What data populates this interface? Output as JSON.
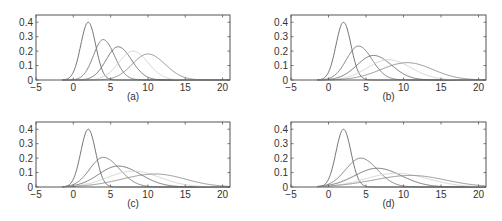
{
  "figure": {
    "width": 502,
    "height": 221,
    "axis_color": "#555555",
    "panels_layout": [
      {
        "id": "a",
        "left": 36,
        "top": 15,
        "right": 230,
        "bottom": 80,
        "label_y": 100
      },
      {
        "id": "b",
        "left": 291,
        "top": 15,
        "right": 486,
        "bottom": 80,
        "label_y": 100
      },
      {
        "id": "c",
        "left": 36,
        "top": 122,
        "right": 230,
        "bottom": 187,
        "label_y": 207
      },
      {
        "id": "d",
        "left": 291,
        "top": 122,
        "right": 486,
        "bottom": 187,
        "label_y": 207
      }
    ]
  },
  "chart_data": [
    {
      "type": "line",
      "panel_label": "(a)",
      "xlim": [
        -5,
        21
      ],
      "ylim": [
        0,
        0.45
      ],
      "xticks": [
        -5,
        0,
        5,
        10,
        15,
        20
      ],
      "xtick_labels": [
        "−5",
        "0",
        "5",
        "10",
        "15",
        "20"
      ],
      "yticks": [
        0,
        0.1,
        0.2,
        0.3,
        0.4
      ],
      "ytick_labels": [
        "0",
        "0.1",
        "0.2",
        "0.3",
        "0.4"
      ],
      "grid": false,
      "legend": null,
      "series": [
        {
          "name": "curve 1",
          "mode": 2,
          "peak": 0.4,
          "sd_left": 1.0,
          "sd_right": 1.0,
          "color": "#666666"
        },
        {
          "name": "curve 2",
          "mode": 4,
          "peak": 0.28,
          "sd_left": 1.3,
          "sd_right": 1.5,
          "color": "#777777"
        },
        {
          "name": "curve 3",
          "mode": 6,
          "peak": 0.23,
          "sd_left": 1.6,
          "sd_right": 1.8,
          "color": "#6a6a6a"
        },
        {
          "name": "curve 4",
          "mode": 8,
          "peak": 0.2,
          "sd_left": 1.9,
          "sd_right": 2.0,
          "color": "#cfcfcf"
        },
        {
          "name": "curve 5",
          "mode": 10,
          "peak": 0.18,
          "sd_left": 2.1,
          "sd_right": 2.3,
          "color": "#8a8a8a"
        }
      ]
    },
    {
      "type": "line",
      "panel_label": "(b)",
      "xlim": [
        -5,
        21
      ],
      "ylim": [
        0,
        0.45
      ],
      "xticks": [
        -5,
        0,
        5,
        10,
        15,
        20
      ],
      "xtick_labels": [
        "−5",
        "0",
        "5",
        "10",
        "15",
        "20"
      ],
      "yticks": [
        0,
        0.1,
        0.2,
        0.3,
        0.4
      ],
      "ytick_labels": [
        "0",
        "0.1",
        "0.2",
        "0.3",
        "0.4"
      ],
      "grid": false,
      "legend": null,
      "series": [
        {
          "name": "curve 1",
          "mode": 2,
          "peak": 0.4,
          "sd_left": 1.0,
          "sd_right": 1.0,
          "color": "#666666"
        },
        {
          "name": "curve 2",
          "mode": 4,
          "peak": 0.235,
          "sd_left": 1.6,
          "sd_right": 1.8,
          "color": "#777777"
        },
        {
          "name": "curve 3",
          "mode": 6,
          "peak": 0.17,
          "sd_left": 2.2,
          "sd_right": 2.4,
          "color": "#6a6a6a"
        },
        {
          "name": "curve 4",
          "mode": 8,
          "peak": 0.14,
          "sd_left": 2.8,
          "sd_right": 3.0,
          "color": "#cfcfcf"
        },
        {
          "name": "curve 5",
          "mode": 10.5,
          "peak": 0.12,
          "sd_left": 3.5,
          "sd_right": 3.4,
          "color": "#8a8a8a"
        }
      ]
    },
    {
      "type": "line",
      "panel_label": "(c)",
      "xlim": [
        -5,
        21
      ],
      "ylim": [
        0,
        0.45
      ],
      "xticks": [
        -5,
        0,
        5,
        10,
        15,
        20
      ],
      "xtick_labels": [
        "−5",
        "0",
        "5",
        "10",
        "15",
        "20"
      ],
      "yticks": [
        0,
        0.1,
        0.2,
        0.3,
        0.4
      ],
      "ytick_labels": [
        "0",
        "0.1",
        "0.2",
        "0.3",
        "0.4"
      ],
      "grid": false,
      "legend": null,
      "series": [
        {
          "name": "curve 1",
          "mode": 2,
          "peak": 0.4,
          "sd_left": 1.0,
          "sd_right": 1.0,
          "color": "#666666"
        },
        {
          "name": "curve 2",
          "mode": 4,
          "peak": 0.205,
          "sd_left": 1.8,
          "sd_right": 2.2,
          "color": "#777777"
        },
        {
          "name": "curve 3",
          "mode": 6,
          "peak": 0.145,
          "sd_left": 2.6,
          "sd_right": 3.0,
          "color": "#6a6a6a"
        },
        {
          "name": "curve 4",
          "mode": 8,
          "peak": 0.11,
          "sd_left": 3.4,
          "sd_right": 3.6,
          "color": "#cfcfcf"
        },
        {
          "name": "curve 5",
          "mode": 11,
          "peak": 0.09,
          "sd_left": 4.5,
          "sd_right": 4.0,
          "color": "#8a8a8a"
        }
      ]
    },
    {
      "type": "line",
      "panel_label": "(d)",
      "xlim": [
        -5,
        21
      ],
      "ylim": [
        0,
        0.45
      ],
      "xticks": [
        -5,
        0,
        5,
        10,
        15,
        20
      ],
      "xtick_labels": [
        "−5",
        "0",
        "5",
        "10",
        "15",
        "20"
      ],
      "yticks": [
        0,
        0.1,
        0.2,
        0.3,
        0.4
      ],
      "ytick_labels": [
        "0",
        "0.1",
        "0.2",
        "0.3",
        "0.4"
      ],
      "grid": false,
      "legend": null,
      "series": [
        {
          "name": "curve 1",
          "mode": 2,
          "peak": 0.4,
          "sd_left": 1.0,
          "sd_right": 1.0,
          "color": "#666666"
        },
        {
          "name": "curve 2",
          "mode": 4.3,
          "peak": 0.2,
          "sd_left": 2.0,
          "sd_right": 2.2,
          "color": "#777777"
        },
        {
          "name": "curve 3",
          "mode": 6.5,
          "peak": 0.13,
          "sd_left": 3.0,
          "sd_right": 3.2,
          "color": "#6a6a6a"
        },
        {
          "name": "curve 4",
          "mode": 9,
          "peak": 0.095,
          "sd_left": 4.0,
          "sd_right": 4.2,
          "color": "#cfcfcf"
        },
        {
          "name": "curve 5",
          "mode": 11,
          "peak": 0.08,
          "sd_left": 5.0,
          "sd_right": 4.6,
          "color": "#8a8a8a"
        }
      ]
    }
  ]
}
